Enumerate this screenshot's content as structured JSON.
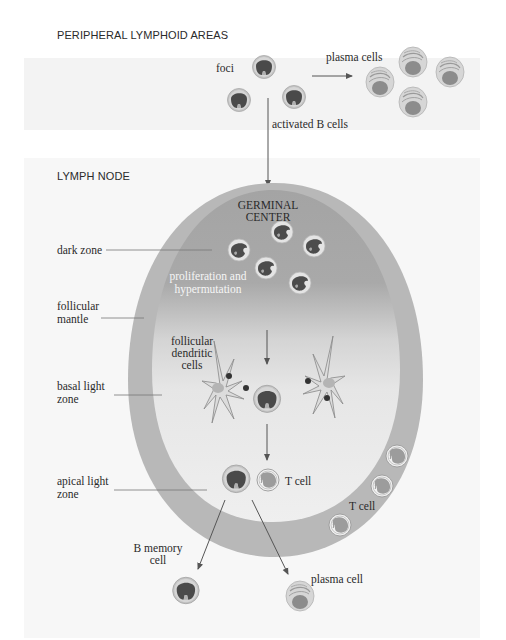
{
  "sections": {
    "peripheral": {
      "title": "PERIPHERAL LYMPHOID AREAS"
    },
    "lymph_node": {
      "title": "LYMPH NODE"
    }
  },
  "labels": {
    "foci": "foci",
    "plasma_cells": "plasma cells",
    "activated_b_cells": "activated B cells",
    "germinal_center_1": "GERMINAL",
    "germinal_center_2": "CENTER",
    "dark_zone": "dark zone",
    "prolif_1": "proliferation and",
    "prolif_2": "hypermutation",
    "follicular_mantle_1": "follicular",
    "follicular_mantle_2": "mantle",
    "fdc_1": "follicular",
    "fdc_2": "dendritic",
    "fdc_3": "cells",
    "basal_1": "basal light",
    "basal_2": "zone",
    "apical_1": "apical light",
    "apical_2": "zone",
    "t_cell_inner": "T cell",
    "t_cell_mantle": "T cell",
    "b_memory_1": "B memory",
    "b_memory_2": "cell",
    "plasma_cell": "plasma cell"
  },
  "colors": {
    "band_bg": "#f1f1f1",
    "mantle": "#b9b9b9",
    "dark_zone": "#a9a9a9",
    "light_zone": "#ececec",
    "nucleus": "#4a4a4a",
    "cell_ring": "#c8c8c8",
    "line": "#555555"
  }
}
